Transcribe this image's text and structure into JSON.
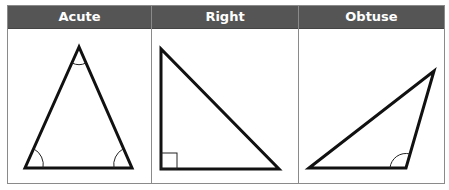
{
  "table": {
    "header_bg": "#555555",
    "columns": [
      {
        "label": "Acute"
      },
      {
        "label": "Right"
      },
      {
        "label": "Obtuse"
      }
    ]
  }
}
